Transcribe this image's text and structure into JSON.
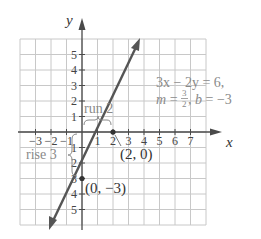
{
  "graph": {
    "axis_labels": {
      "x": "x",
      "y": "y"
    },
    "x_ticks": [
      "-3",
      "-2",
      "-1",
      "1",
      "2",
      "3",
      "4",
      "5",
      "6",
      "7"
    ],
    "y_ticks_positive": [
      "1",
      "2",
      "3",
      "4",
      "5"
    ],
    "y_ticks_negative": [
      "1",
      "2",
      "3",
      "4",
      "5"
    ],
    "x_range": [
      -4,
      8
    ],
    "y_range": [
      -6,
      6
    ],
    "line": {
      "equation": "3x − 2y = 6",
      "slope": "3/2",
      "intercept": "-3"
    },
    "points": [
      {
        "label": "(2, 0)",
        "x": 2,
        "y": 0
      },
      {
        "label": "(0, −3)",
        "x": 0,
        "y": -3
      }
    ],
    "annotations": {
      "run": "run 2",
      "rise": "rise 3",
      "equation_line1": "3x − 2y = 6,",
      "slope_prefix": "m = ",
      "slope_num": "3",
      "slope_den": "2",
      "intercept_text": ", b = −3"
    },
    "colors": {
      "grid": "#c8c8c8",
      "axis": "#4a4a4a",
      "line": "#555555",
      "annotation_text": "#8a8a8a",
      "text": "#333333"
    }
  }
}
